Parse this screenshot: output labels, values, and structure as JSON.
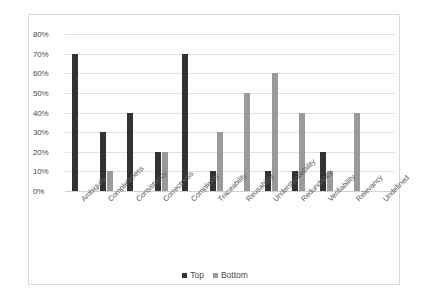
{
  "chart_data": {
    "type": "bar",
    "title": "",
    "xlabel": "",
    "ylabel": "",
    "ylim": [
      0,
      80
    ],
    "ytick_labels": [
      "0%",
      "10%",
      "20%",
      "30%",
      "40%",
      "50%",
      "60%",
      "70%",
      "80%"
    ],
    "ytick_values": [
      0,
      10,
      20,
      30,
      40,
      50,
      60,
      70,
      80
    ],
    "grid": true,
    "legend_position": "bottom-center",
    "categories": [
      "Ambiguity",
      "Completeness",
      "Consistency",
      "Correctness",
      "Complexity",
      "Traceability",
      "Reusability",
      "Understandability",
      "Redundancy",
      "Verifiability",
      "Relevancy",
      "Undefined"
    ],
    "series": [
      {
        "name": "Top",
        "color": "#333333",
        "values": [
          70,
          30,
          40,
          20,
          70,
          10,
          0,
          10,
          10,
          20,
          0,
          0
        ]
      },
      {
        "name": "Bottom",
        "color": "#9a9a9a",
        "values": [
          0,
          10,
          0,
          20,
          0,
          30,
          50,
          60,
          40,
          10,
          40,
          0
        ]
      }
    ]
  },
  "legend": {
    "items": [
      {
        "label": "Top",
        "swatch": "top"
      },
      {
        "label": "Bottom",
        "swatch": "bottom"
      }
    ]
  },
  "colors": {
    "top_series": "#333333",
    "bottom_series": "#9a9a9a",
    "gridline": "#e2e2e2",
    "border": "#d9d9d9",
    "background": "#ffffff",
    "tick_text": "#4a4a4a"
  }
}
